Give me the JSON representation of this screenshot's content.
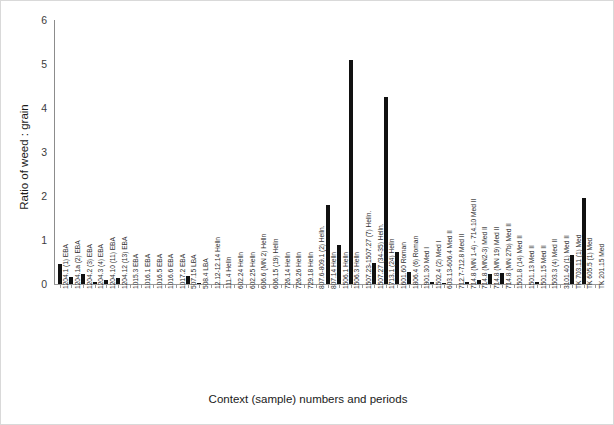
{
  "chart": {
    "type": "bar",
    "ylabel": "Ratio of weed : grain",
    "xlabel": "Context (sample) numbers and periods",
    "bar_color": "#111111",
    "axis_color": "#9a9a9a"
  },
  "chart_data": {
    "type": "bar",
    "title": "",
    "xlabel": "Context (sample) numbers and periods",
    "ylabel": "Ratio of weed : grain",
    "ylim": [
      0,
      6
    ],
    "yticks": [
      0,
      1,
      2,
      3,
      4,
      5,
      6
    ],
    "grid": false,
    "legend": false,
    "categories": [
      "1204.1 (1) EBA",
      "1204.1a (2) EBA",
      "1204.2 (3) EBA",
      "1204.3 (4) EBA",
      "1204.10 (11) EBA",
      "1204.12 (13) EBA",
      "1015.3 EBA",
      "1016.1 EBA",
      "1016.5 EBA",
      "1016.6 EBA",
      "1017.2 EBA",
      "507.15 LBA",
      "508.4 LBA",
      "12.12-12.14 Helln",
      "111.4 Helln",
      "602.24 Helln",
      "602.25 Helln",
      "606.6 (MN 2) Helln",
      "606.15 (19) Helln",
      "726.14 Helln",
      "726.26 Helln",
      "729.18 Helln",
      "807.6-809.1 (2) Helln.",
      "807.14 Helln",
      "1506.1 Helln",
      "1506.3 Helln",
      "1507.23-1507.27 (7) Helln.",
      "1507.27 (34-35) Helln.",
      "1713.1 (24) Helln",
      "1601.60 Roman",
      "1806.4 (6) Roman",
      "1901.30 Med I",
      "1502.4 (2) Med I",
      "603.13-606.4 Med II",
      "712.7-712.8 Med II",
      "714.8 (MN 1-4) - 714.10 Med II",
      "714.8 (MN2-3) Med II",
      "714.8 (MN 19) Med II",
      "714.8 (MN 27b) Med II",
      "1501.8 (14) Med II",
      "1501.13 Med II",
      "1501.15 Med II",
      "1503.3 (4) Med II",
      "3101.40 (1) Med II",
      "TK 703.11 (1) Med",
      "TK 605.5 (1) Med",
      "TK 201.15 Med"
    ],
    "values": [
      0.45,
      0.16,
      0.23,
      0.05,
      0.09,
      0.14,
      0,
      0,
      0,
      0,
      0,
      0.18,
      0.02,
      0,
      0,
      0,
      0,
      0,
      0,
      0,
      0,
      0,
      0,
      1.8,
      0.88,
      5.1,
      0,
      0.48,
      4.25,
      0.72,
      0.28,
      0,
      0.04,
      0.02,
      0,
      0.05,
      0.1,
      0.22,
      0.24,
      0,
      0,
      0.04,
      0,
      0,
      0.65,
      1.95,
      0
    ]
  }
}
